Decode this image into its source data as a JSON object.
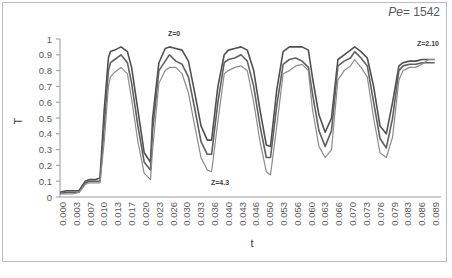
{
  "chart_data": {
    "type": "line",
    "title": "",
    "xlabel": "t",
    "ylabel": "T",
    "ylim": [
      0,
      1
    ],
    "yticks": [
      "0",
      "0.1",
      "0.2",
      "0.3",
      "0.4",
      "0.5",
      "0.6",
      "0.7",
      "0.8",
      "0.9",
      "1"
    ],
    "categories": [
      "0.000",
      "0.003",
      "0.007",
      "0.010",
      "0.013",
      "0.017",
      "0.020",
      "0.023",
      "0.026",
      "0.030",
      "0.033",
      "0.036",
      "0.040",
      "0.043",
      "0.046",
      "0.050",
      "0.053",
      "0.056",
      "0.060",
      "0.063",
      "0.066",
      "0.070",
      "0.073",
      "0.076",
      "0.079",
      "0.083",
      "0.086",
      "0.089"
    ],
    "grid": false,
    "legend": "none",
    "annotations": [
      {
        "text": "Pe= 1542",
        "italic_part": "Pe",
        "position": "top-right"
      },
      {
        "text": "Z=0",
        "near_t": 0.026,
        "near_T": 1.0
      },
      {
        "text": "Z=4.3",
        "near_t": 0.036,
        "near_T": 0.07
      },
      {
        "text": "Z=2.10",
        "near_t": 0.087,
        "near_T": 0.94
      }
    ],
    "series": [
      {
        "name": "Z=0",
        "color": "#505050",
        "x": [
          0.0,
          0.0015,
          0.003,
          0.0045,
          0.006,
          0.007,
          0.0085,
          0.0095,
          0.0105,
          0.0115,
          0.012,
          0.013,
          0.0145,
          0.016,
          0.017,
          0.0185,
          0.02,
          0.0215,
          0.022,
          0.0235,
          0.025,
          0.026,
          0.0275,
          0.029,
          0.0305,
          0.032,
          0.0335,
          0.035,
          0.036,
          0.0375,
          0.039,
          0.04,
          0.0415,
          0.043,
          0.0445,
          0.046,
          0.0475,
          0.049,
          0.05,
          0.0515,
          0.053,
          0.0545,
          0.056,
          0.0575,
          0.059,
          0.06,
          0.0615,
          0.063,
          0.0645,
          0.066,
          0.0675,
          0.069,
          0.07,
          0.0715,
          0.073,
          0.0745,
          0.076,
          0.0775,
          0.079,
          0.0805,
          0.0815,
          0.083,
          0.0845,
          0.086,
          0.0875,
          0.089
        ],
        "values": [
          0.03,
          0.04,
          0.04,
          0.04,
          0.1,
          0.11,
          0.11,
          0.12,
          0.55,
          0.88,
          0.92,
          0.93,
          0.95,
          0.92,
          0.82,
          0.55,
          0.28,
          0.22,
          0.5,
          0.85,
          0.94,
          0.95,
          0.94,
          0.93,
          0.86,
          0.66,
          0.45,
          0.36,
          0.36,
          0.7,
          0.9,
          0.93,
          0.94,
          0.95,
          0.93,
          0.8,
          0.55,
          0.33,
          0.32,
          0.68,
          0.92,
          0.95,
          0.95,
          0.95,
          0.93,
          0.75,
          0.52,
          0.41,
          0.5,
          0.87,
          0.9,
          0.93,
          0.95,
          0.92,
          0.88,
          0.7,
          0.45,
          0.4,
          0.6,
          0.83,
          0.85,
          0.86,
          0.86,
          0.87,
          0.87,
          0.87
        ]
      },
      {
        "name": "middle",
        "color": "#606060",
        "x": [
          0.0,
          0.0015,
          0.003,
          0.0045,
          0.006,
          0.007,
          0.0085,
          0.0095,
          0.0105,
          0.0115,
          0.012,
          0.013,
          0.0145,
          0.016,
          0.017,
          0.0185,
          0.02,
          0.0215,
          0.022,
          0.0235,
          0.025,
          0.026,
          0.0275,
          0.029,
          0.0305,
          0.032,
          0.0335,
          0.035,
          0.036,
          0.0375,
          0.039,
          0.04,
          0.0415,
          0.043,
          0.0445,
          0.046,
          0.0475,
          0.049,
          0.05,
          0.0515,
          0.053,
          0.0545,
          0.056,
          0.0575,
          0.059,
          0.06,
          0.0615,
          0.063,
          0.0645,
          0.066,
          0.0675,
          0.069,
          0.07,
          0.0715,
          0.073,
          0.0745,
          0.076,
          0.0775,
          0.079,
          0.0805,
          0.0815,
          0.083,
          0.0845,
          0.086,
          0.0875,
          0.089
        ],
        "values": [
          0.02,
          0.03,
          0.03,
          0.03,
          0.09,
          0.1,
          0.1,
          0.1,
          0.45,
          0.8,
          0.85,
          0.87,
          0.9,
          0.85,
          0.72,
          0.45,
          0.22,
          0.17,
          0.42,
          0.8,
          0.86,
          0.9,
          0.86,
          0.84,
          0.76,
          0.56,
          0.35,
          0.27,
          0.27,
          0.6,
          0.85,
          0.87,
          0.88,
          0.9,
          0.86,
          0.7,
          0.45,
          0.25,
          0.25,
          0.58,
          0.84,
          0.87,
          0.88,
          0.86,
          0.82,
          0.65,
          0.42,
          0.32,
          0.42,
          0.83,
          0.86,
          0.88,
          0.92,
          0.88,
          0.83,
          0.6,
          0.37,
          0.31,
          0.5,
          0.8,
          0.83,
          0.84,
          0.84,
          0.85,
          0.85,
          0.85
        ]
      },
      {
        "name": "Z=4.3",
        "color": "#8c8c8c",
        "x": [
          0.0,
          0.0015,
          0.003,
          0.0045,
          0.006,
          0.007,
          0.0085,
          0.0095,
          0.0105,
          0.0115,
          0.012,
          0.013,
          0.0145,
          0.016,
          0.017,
          0.0185,
          0.02,
          0.0215,
          0.022,
          0.0235,
          0.025,
          0.026,
          0.0275,
          0.029,
          0.0305,
          0.032,
          0.0335,
          0.035,
          0.036,
          0.0375,
          0.039,
          0.04,
          0.0415,
          0.043,
          0.0445,
          0.046,
          0.0475,
          0.049,
          0.05,
          0.0515,
          0.053,
          0.0545,
          0.056,
          0.0575,
          0.059,
          0.06,
          0.0615,
          0.063,
          0.0645,
          0.066,
          0.0675,
          0.069,
          0.07,
          0.0715,
          0.073,
          0.0745,
          0.076,
          0.0775,
          0.079,
          0.0805,
          0.0815,
          0.083,
          0.0845,
          0.086,
          0.0875,
          0.089
        ],
        "values": [
          0.02,
          0.02,
          0.02,
          0.03,
          0.08,
          0.09,
          0.09,
          0.09,
          0.35,
          0.7,
          0.76,
          0.79,
          0.82,
          0.78,
          0.62,
          0.35,
          0.15,
          0.11,
          0.3,
          0.72,
          0.8,
          0.82,
          0.82,
          0.78,
          0.66,
          0.45,
          0.25,
          0.17,
          0.16,
          0.48,
          0.78,
          0.8,
          0.82,
          0.83,
          0.8,
          0.6,
          0.35,
          0.16,
          0.14,
          0.45,
          0.78,
          0.8,
          0.83,
          0.84,
          0.8,
          0.55,
          0.32,
          0.25,
          0.3,
          0.74,
          0.8,
          0.83,
          0.87,
          0.82,
          0.76,
          0.5,
          0.28,
          0.25,
          0.38,
          0.74,
          0.8,
          0.82,
          0.82,
          0.84,
          0.87,
          0.87
        ]
      }
    ]
  },
  "plot": {
    "xlabel": "t",
    "ylabel": "T",
    "pe_label_italic": "Pe",
    "pe_label_rest": "= 1542",
    "annot_z0": "Z=0",
    "annot_z43": "Z=4.3",
    "annot_z210": "Z=2.10"
  }
}
